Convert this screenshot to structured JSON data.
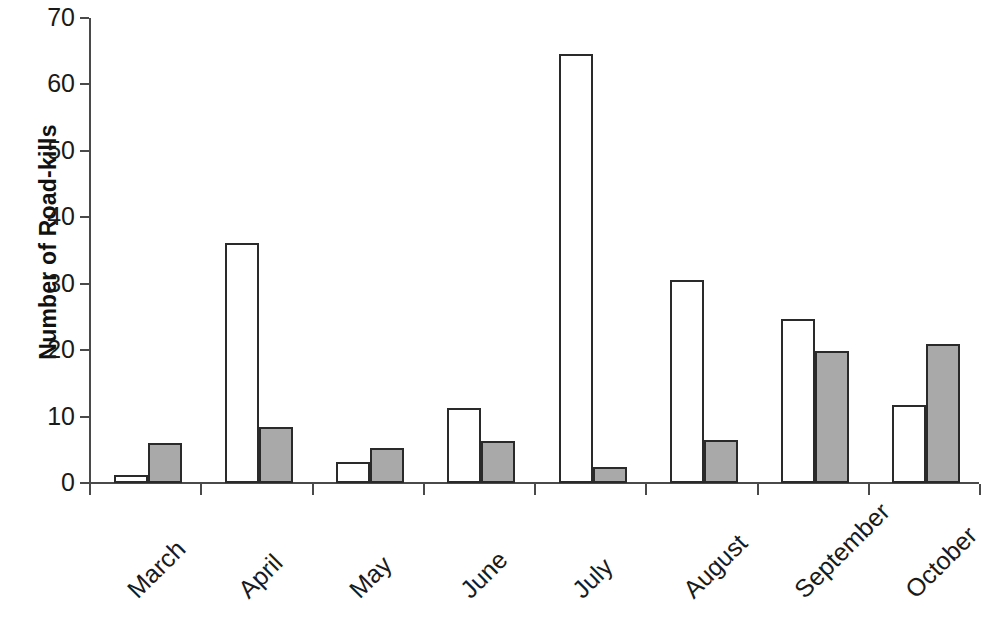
{
  "chart_data": {
    "type": "bar",
    "title": "",
    "xlabel": "",
    "ylabel": "Number of Road-kills",
    "categories": [
      "March",
      "April",
      "May",
      "June",
      "July",
      "August",
      "September",
      "October"
    ],
    "series": [
      {
        "name": "Series 1",
        "color": "#ffffff",
        "values": [
          1.2,
          36.2,
          3.2,
          11.3,
          64.6,
          30.6,
          24.7,
          11.8
        ]
      },
      {
        "name": "Series 2",
        "color": "#a9a9a9",
        "values": [
          6.0,
          8.4,
          5.3,
          6.3,
          2.4,
          6.5,
          19.8,
          21.0
        ]
      }
    ],
    "ylim": [
      0,
      70
    ],
    "ytick_labels": [
      "0",
      "10",
      "20",
      "30",
      "40",
      "50",
      "60",
      "70"
    ],
    "ytick_values": [
      0,
      10,
      20,
      30,
      40,
      50,
      60,
      70
    ],
    "grid": false,
    "legend": "none",
    "axis_color": "#4a4a4a",
    "bar_outline_color": "#2a2a2a",
    "background_color": "#ffffff"
  }
}
